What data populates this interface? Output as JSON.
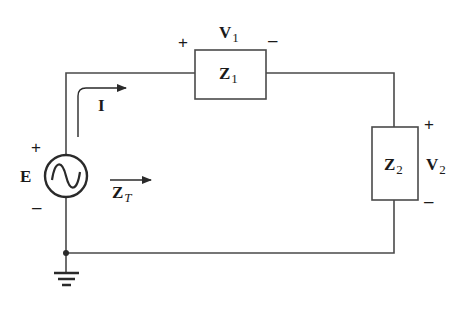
{
  "diagram": {
    "type": "series AC circuit",
    "source": {
      "label": "E",
      "plus": "+",
      "minus": "–",
      "symbol": "sine-wave"
    },
    "current": {
      "label": "I"
    },
    "total_impedance": {
      "label": "Z",
      "subscript": "T"
    },
    "z1": {
      "label": "Z",
      "subscript": "1",
      "voltage_label": "V",
      "voltage_subscript": "1",
      "plus": "+",
      "minus": "–"
    },
    "z2": {
      "label": "Z",
      "subscript": "2",
      "voltage_label": "V",
      "voltage_subscript": "2",
      "plus": "+",
      "minus": "–"
    },
    "ground": {
      "symbol": "ground"
    },
    "colors": {
      "wire": "#4a4a4a",
      "text": "#1a1a1a",
      "background": "#ffffff"
    }
  }
}
